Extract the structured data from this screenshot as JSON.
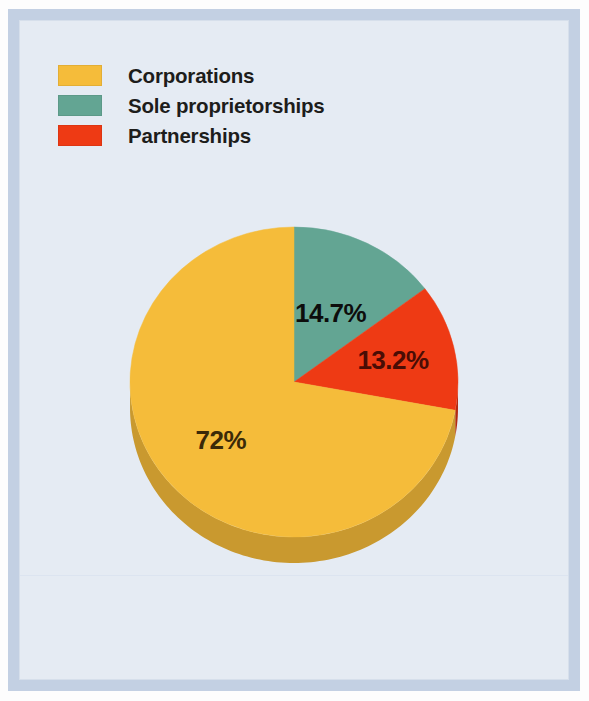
{
  "figure": {
    "background_color": "#e5ebf3",
    "frame_color": "#c3d0e3"
  },
  "legend": {
    "position": "top-left",
    "items": [
      {
        "label": "Corporations",
        "color": "#f5bc3a"
      },
      {
        "label": "Sole proprietorships",
        "color": "#63a593"
      },
      {
        "label": "Partnerships",
        "color": "#ee3a14"
      }
    ]
  },
  "chart_data": {
    "type": "pie",
    "title": "",
    "subtitle": "",
    "xlabel": "",
    "ylabel": "",
    "grid": false,
    "legend_position": "top-left",
    "start_angle_deg": 0,
    "direction": "clockwise",
    "three_d": true,
    "categories": [
      "Corporations",
      "Sole proprietorships",
      "Partnerships"
    ],
    "values": [
      72,
      14.7,
      13.2
    ],
    "labels": [
      "72%",
      "14.7%",
      "13.2%"
    ],
    "slices": [
      {
        "name": "Sole proprietorships",
        "value": 14.7,
        "label": "14.7%",
        "color": "#63a593",
        "edge_color": "#3f7a6b",
        "label_color": "#0d0d0c"
      },
      {
        "name": "Partnerships",
        "value": 13.2,
        "label": "13.2%",
        "color": "#ee3a14",
        "edge_color": "#b32a0f",
        "label_color": "#4a0d05"
      },
      {
        "name": "Corporations",
        "value": 72,
        "label": "72%",
        "color": "#f5bc3a",
        "edge_color": "#c9992f",
        "label_color": "#3b2a08"
      }
    ]
  }
}
